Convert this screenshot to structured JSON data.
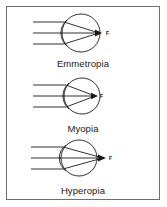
{
  "figure": {
    "background_color": "#ffffff",
    "border_color": "#6e6e6e",
    "line_color": "#1a1a1a",
    "text_color": "#1a1a1a"
  },
  "panels": [
    {
      "label": "Emmetropia",
      "focal_point_label": "F",
      "ray_count": 3,
      "description": "Parallel light rays focus exactly on the retina at the back of the eye",
      "focus_position": "on-retina"
    },
    {
      "label": "Myopia",
      "focal_point_label": "F",
      "ray_count": 3,
      "description": "Parallel light rays focus in front of the retina inside the eye",
      "focus_position": "before-retina"
    },
    {
      "label": "Hyperopia",
      "focal_point_label": "F",
      "ray_count": 3,
      "description": "Parallel light rays focus behind the retina",
      "focus_position": "behind-retina"
    }
  ]
}
